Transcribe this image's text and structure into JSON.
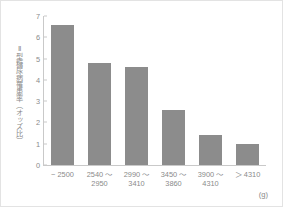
{
  "chart_data": {
    "type": "bar",
    "title": "",
    "subtitle": "",
    "xlabel": "",
    "xlabel_unit": "(g)",
    "ylabel": "Ⅱ型糖尿病罹患率（オッズ比）",
    "categories": [
      "− 2500",
      "2540 〜\n2950",
      "2990 〜\n3410",
      "3450 〜\n3860",
      "3900 〜\n4310",
      "＞ 4310"
    ],
    "category_lines": [
      [
        "− 2500"
      ],
      [
        "2540 〜",
        "2950"
      ],
      [
        "2990 〜",
        "3410"
      ],
      [
        "3450 〜",
        "3860"
      ],
      [
        "3900 〜",
        "4310"
      ],
      [
        "＞ 4310"
      ]
    ],
    "values": [
      6.6,
      4.8,
      4.6,
      2.6,
      1.4,
      1.0
    ],
    "ylim": [
      0,
      7
    ],
    "yticks": [
      0,
      1,
      2,
      3,
      4,
      5,
      6,
      7
    ],
    "ytick_labels": [
      "0",
      "1",
      "2",
      "3",
      "4",
      "5",
      "6",
      "7"
    ],
    "grid": false,
    "legend": null,
    "bar_color": "#8c8c8c",
    "axis_color": "#c9c9c9",
    "text_color": "#8a8a8a",
    "frame_color": "#e3e3e3"
  }
}
